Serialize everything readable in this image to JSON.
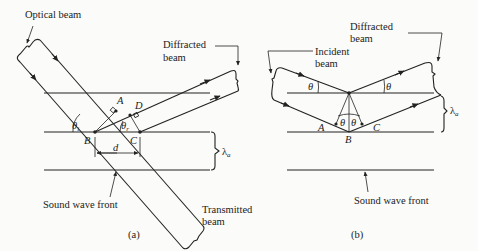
{
  "figure": {
    "panels": [
      {
        "id": "a",
        "caption": "(a)",
        "labels": {
          "optical_beam": "Optical beam",
          "diffracted_beam_line1": "Diffracted",
          "diffracted_beam_line2": "beam",
          "transmitted_beam_line1": "Transmitted",
          "transmitted_beam_line2": "beam",
          "sound_wave_front": "Sound wave front",
          "wavelength": "λ",
          "wavelength_sub": "a",
          "point_a": "A",
          "point_b": "B",
          "point_c": "C",
          "point_d": "D",
          "distance": "d",
          "theta_i": "θ",
          "theta_i_sub": "i",
          "theta_r": "θ",
          "theta_r_sub": "r"
        }
      },
      {
        "id": "b",
        "caption": "(b)",
        "labels": {
          "incident_beam_line1": "Incident",
          "incident_beam_line2": "beam",
          "diffracted_beam_line1": "Diffracted",
          "diffracted_beam_line2": "beam",
          "sound_wave_front": "Sound wave front",
          "wavelength": "λ",
          "wavelength_sub": "a",
          "point_a": "A",
          "point_b": "B",
          "point_c": "C",
          "theta": "θ"
        }
      }
    ]
  }
}
